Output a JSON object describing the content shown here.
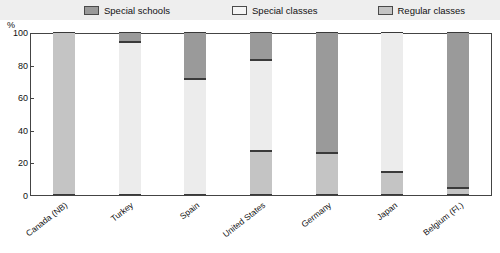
{
  "chart_data": {
    "type": "bar",
    "title": "",
    "subtitle": "",
    "xlabel": "",
    "ylabel": "%",
    "ylim": [
      0,
      100
    ],
    "yticks": [
      0,
      20,
      40,
      60,
      80,
      100
    ],
    "grid": false,
    "stacked": true,
    "stack_mode": "percent",
    "legend_position": "top",
    "categories": [
      "Canada (NB)",
      "Turkey",
      "Spain",
      "United States",
      "Germany",
      "Japan",
      "Belgium (Fl.)"
    ],
    "series": [
      {
        "name": "Special schools",
        "color": "#9a9a9a",
        "values": [
          0,
          6,
          29,
          17,
          74,
          0,
          96
        ]
      },
      {
        "name": "Special classes",
        "color": "#ececec",
        "values": [
          0,
          94,
          71,
          56,
          0,
          86,
          0
        ]
      },
      {
        "name": "Regular classes",
        "color": "#c4c4c4",
        "values": [
          100,
          0,
          0,
          27,
          26,
          14,
          4
        ]
      }
    ],
    "annotations": []
  },
  "legend": {
    "items": [
      {
        "label": "Special schools",
        "color": "#9a9a9a"
      },
      {
        "label": "Special classes",
        "color": "#ececec"
      },
      {
        "label": "Regular classes",
        "color": "#c4c4c4"
      }
    ]
  },
  "axis": {
    "y_unit_label": "%",
    "y_tick_labels": [
      "100",
      "80",
      "60",
      "40",
      "20",
      "0"
    ]
  }
}
